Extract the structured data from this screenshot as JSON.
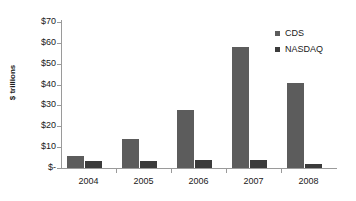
{
  "chart_data": {
    "type": "bar",
    "title": "",
    "subtitle": "",
    "xlabel": "",
    "ylabel": "$ trillions",
    "categories": [
      "2004",
      "2005",
      "2006",
      "2007",
      "2008"
    ],
    "series": [
      {
        "name": "CDS",
        "color": "#5c5c5c",
        "values": [
          6,
          14,
          28,
          58,
          41
        ]
      },
      {
        "name": "NASDAQ",
        "color": "#3b3b3b",
        "values": [
          3.5,
          3.5,
          3.8,
          3.8,
          2
        ]
      }
    ],
    "ylim": [
      0,
      70
    ],
    "ytick_values": [
      70,
      60,
      50,
      40,
      30,
      20,
      10,
      0
    ],
    "ytick_labels": [
      "$70",
      "$60",
      "$50",
      "$40",
      "$30",
      "$20",
      "$10",
      "$-"
    ],
    "grid": false,
    "legend_position": "top-right",
    "annotations": []
  },
  "legend": {
    "items": [
      {
        "label": "CDS"
      },
      {
        "label": "NASDAQ"
      }
    ]
  }
}
